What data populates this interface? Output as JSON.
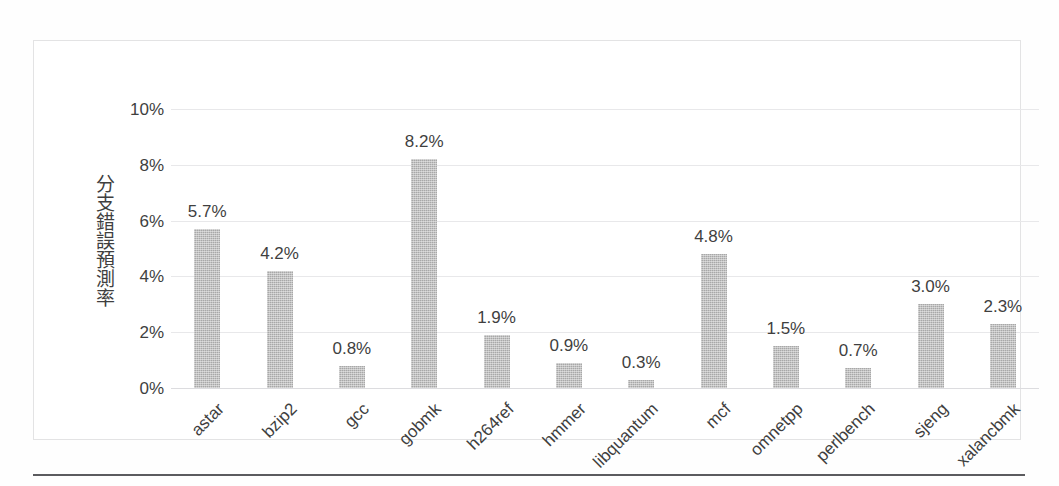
{
  "chart_data": {
    "type": "bar",
    "title": "",
    "subtitle": "",
    "xlabel": "",
    "ylabel": "分支錯誤預測率",
    "categories": [
      "astar",
      "bzip2",
      "gcc",
      "gobmk",
      "h264ref",
      "hmmer",
      "libquantum",
      "mcf",
      "omnetpp",
      "perlbench",
      "sjeng",
      "xalancbmk"
    ],
    "values": [
      5.7,
      4.2,
      0.8,
      8.2,
      1.9,
      0.9,
      0.3,
      4.8,
      1.5,
      0.7,
      3.0,
      2.3
    ],
    "value_labels": [
      "5.7%",
      "4.2%",
      "0.8%",
      "8.2%",
      "1.9%",
      "0.9%",
      "0.3%",
      "4.8%",
      "1.5%",
      "0.7%",
      "3.0%",
      "2.3%"
    ],
    "ylim": [
      0,
      10
    ],
    "ytick_values": [
      10,
      8,
      6,
      4,
      2,
      0
    ],
    "ytick_labels": [
      "10%",
      "8%",
      "6%",
      "4%",
      "2%",
      "0%"
    ],
    "grid": true,
    "grid_axis": "y",
    "legend": false,
    "legend_position": "none",
    "bar_color": "#a8a8a8",
    "gridline_color": "#e8e8ea",
    "text_color": "#3f3f3f",
    "frame_color": "#e3e3e4",
    "rule_color": "#5b5b5f",
    "background": "#ffffff",
    "xlabel_rotation": -45,
    "data_labels_shown": true,
    "units": "percent"
  }
}
